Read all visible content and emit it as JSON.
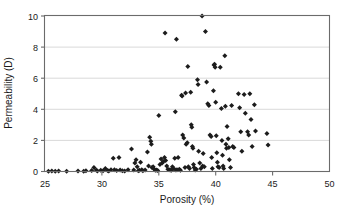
{
  "chart_data": {
    "type": "scatter",
    "title": "",
    "xlabel": "Porosity (%)",
    "ylabel": "Permeability (D)",
    "xlim": [
      25,
      50
    ],
    "ylim": [
      0,
      10
    ],
    "xticks": [
      25,
      30,
      35,
      40,
      45,
      50
    ],
    "yticks": [
      0,
      2,
      4,
      6,
      8,
      10
    ],
    "xtick_labels": [
      "25",
      "30",
      "35",
      "40",
      "45",
      "50"
    ],
    "ytick_labels": [
      "0",
      "2",
      "4",
      "6",
      "8",
      "10"
    ],
    "grid": "horizontal",
    "legend": "none",
    "marker": "diamond",
    "marker_color": "#1c1c1c",
    "series": [
      {
        "name": "samples",
        "points": [
          [
            25.3,
            0.02
          ],
          [
            25.6,
            0.03
          ],
          [
            25.9,
            0.02
          ],
          [
            26.2,
            0.04
          ],
          [
            26.9,
            0.02
          ],
          [
            27.9,
            0.03
          ],
          [
            28.4,
            0.02
          ],
          [
            28.6,
            0.05
          ],
          [
            29.1,
            0.06
          ],
          [
            29.3,
            0.25
          ],
          [
            29.5,
            0.1
          ],
          [
            29.6,
            0.04
          ],
          [
            29.9,
            0.08
          ],
          [
            30.1,
            0.05
          ],
          [
            30.3,
            0.2
          ],
          [
            30.5,
            0.07
          ],
          [
            30.6,
            0.03
          ],
          [
            30.8,
            0.12
          ],
          [
            31.0,
            0.85
          ],
          [
            31.1,
            0.12
          ],
          [
            31.3,
            0.06
          ],
          [
            31.5,
            0.9
          ],
          [
            31.6,
            0.1
          ],
          [
            31.8,
            0.05
          ],
          [
            32.0,
            0.03
          ],
          [
            32.3,
            0.12
          ],
          [
            32.6,
            1.45
          ],
          [
            32.8,
            0.1
          ],
          [
            32.9,
            0.55
          ],
          [
            33.0,
            0.75
          ],
          [
            33.1,
            0.3
          ],
          [
            33.2,
            0.05
          ],
          [
            33.3,
            0.08
          ],
          [
            33.4,
            0.6
          ],
          [
            33.5,
            0.12
          ],
          [
            33.6,
            0.05
          ],
          [
            33.8,
            0.1
          ],
          [
            34.0,
            1.25
          ],
          [
            34.1,
            0.35
          ],
          [
            34.2,
            2.2
          ],
          [
            34.3,
            1.95
          ],
          [
            34.35,
            1.75
          ],
          [
            34.4,
            0.25
          ],
          [
            34.5,
            0.3
          ],
          [
            34.6,
            0.15
          ],
          [
            34.7,
            0.08
          ],
          [
            34.8,
            0.1
          ],
          [
            34.9,
            0.06
          ],
          [
            35.0,
            3.6
          ],
          [
            35.1,
            0.45
          ],
          [
            35.2,
            0.8
          ],
          [
            35.3,
            0.55
          ],
          [
            35.4,
            0.65
          ],
          [
            35.5,
            0.9
          ],
          [
            35.55,
            8.9
          ],
          [
            35.6,
            0.7
          ],
          [
            35.7,
            0.35
          ],
          [
            35.8,
            0.15
          ],
          [
            35.9,
            0.12
          ],
          [
            36.0,
            0.1
          ],
          [
            36.1,
            0.08
          ],
          [
            36.2,
            0.3
          ],
          [
            36.3,
            0.2
          ],
          [
            36.4,
            0.85
          ],
          [
            36.45,
            3.85
          ],
          [
            36.5,
            0.1
          ],
          [
            36.55,
            8.5
          ],
          [
            36.6,
            0.12
          ],
          [
            36.7,
            0.9
          ],
          [
            36.8,
            0.15
          ],
          [
            36.9,
            0.08
          ],
          [
            37.0,
            4.9
          ],
          [
            37.05,
            4.85
          ],
          [
            37.1,
            2.35
          ],
          [
            37.2,
            2.15
          ],
          [
            37.3,
            0.25
          ],
          [
            37.35,
            5.05
          ],
          [
            37.4,
            1.75
          ],
          [
            37.5,
            1.85
          ],
          [
            37.55,
            6.75
          ],
          [
            37.6,
            0.3
          ],
          [
            37.7,
            0.2
          ],
          [
            37.8,
            5.1
          ],
          [
            37.85,
            3.0
          ],
          [
            37.9,
            2.85
          ],
          [
            37.95,
            1.6
          ],
          [
            38.0,
            1.5
          ],
          [
            38.05,
            0.45
          ],
          [
            38.1,
            0.25
          ],
          [
            38.2,
            0.1
          ],
          [
            38.3,
            0.15
          ],
          [
            38.4,
            5.9
          ],
          [
            38.45,
            5.6
          ],
          [
            38.5,
            1.3
          ],
          [
            38.6,
            0.55
          ],
          [
            38.7,
            0.2
          ],
          [
            38.8,
            10.0
          ],
          [
            38.85,
            0.35
          ],
          [
            38.9,
            1.15
          ],
          [
            39.0,
            0.3
          ],
          [
            39.1,
            9.0
          ],
          [
            39.2,
            5.75
          ],
          [
            39.3,
            4.35
          ],
          [
            39.4,
            4.25
          ],
          [
            39.5,
            2.35
          ],
          [
            39.6,
            2.25
          ],
          [
            39.65,
            0.9
          ],
          [
            39.7,
            0.2
          ],
          [
            39.8,
            5.2
          ],
          [
            39.85,
            6.85
          ],
          [
            39.9,
            6.9
          ],
          [
            39.95,
            6.7
          ],
          [
            40.0,
            4.45
          ],
          [
            40.05,
            2.3
          ],
          [
            40.1,
            1.2
          ],
          [
            40.15,
            0.6
          ],
          [
            40.2,
            0.3
          ],
          [
            40.3,
            0.25
          ],
          [
            40.4,
            6.7
          ],
          [
            40.5,
            4.05
          ],
          [
            40.55,
            2.0
          ],
          [
            40.6,
            1.05
          ],
          [
            40.65,
            0.35
          ],
          [
            40.7,
            0.2
          ],
          [
            40.8,
            7.45
          ],
          [
            40.85,
            4.2
          ],
          [
            40.9,
            1.75
          ],
          [
            40.95,
            1.5
          ],
          [
            41.0,
            2.9
          ],
          [
            41.1,
            2.1
          ],
          [
            41.15,
            1.55
          ],
          [
            41.2,
            0.75
          ],
          [
            41.3,
            0.25
          ],
          [
            41.4,
            4.25
          ],
          [
            41.5,
            1.6
          ],
          [
            41.6,
            1.55
          ],
          [
            42.0,
            5.0
          ],
          [
            42.1,
            4.1
          ],
          [
            42.2,
            2.55
          ],
          [
            42.3,
            1.3
          ],
          [
            42.5,
            4.95
          ],
          [
            42.6,
            3.75
          ],
          [
            42.8,
            2.55
          ],
          [
            42.9,
            2.35
          ],
          [
            43.0,
            5.0
          ],
          [
            43.1,
            3.35
          ],
          [
            43.2,
            1.6
          ],
          [
            43.4,
            4.3
          ],
          [
            43.5,
            2.6
          ],
          [
            44.5,
            2.45
          ],
          [
            44.6,
            1.7
          ]
        ]
      }
    ]
  },
  "axes": {
    "x_title": "Porosity (%)",
    "y_title": "Permeability (D)"
  }
}
